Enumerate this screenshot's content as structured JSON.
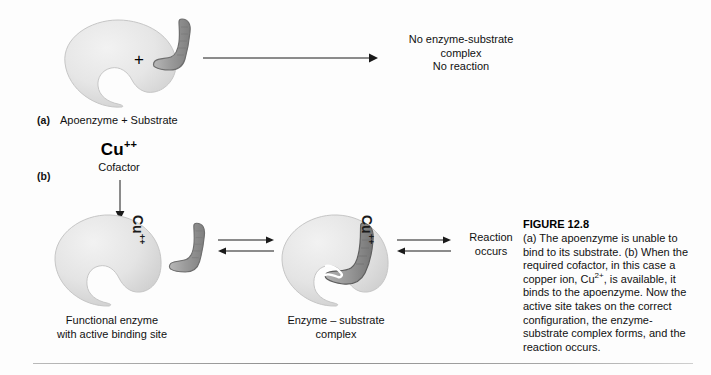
{
  "figure": {
    "title": "FIGURE 12.8",
    "caption_lines": [
      "(a) The apoenzyme is unable to",
      "bind to its substrate. (b) When the",
      "required cofactor, in this case a",
      "copper ion, Cu2+, is available, it",
      "binds to the apoenzyme. Now the",
      "active site takes on the correct",
      "configuration, the enzyme-",
      "substrate complex forms, and the",
      "reaction occurs."
    ],
    "caption_text": "(a) The apoenzyme is unable to bind to its substrate. (b) When the required cofactor, in this case a copper ion, Cu2+, is available, it binds to the apoenzyme. Now the active site takes on the correct configuration, the enzyme-substrate complex forms, and the reaction occurs.",
    "caption_ion_base": "Cu",
    "caption_ion_charge": "2+"
  },
  "panel_a": {
    "label": "(a)",
    "caption": "Apoenzyme + Substrate",
    "plus": "+",
    "outcome_lines": [
      "No enzyme-substrate",
      "complex",
      "No reaction"
    ],
    "enzyme_name": "apoenzyme-shape",
    "substrate_name": "substrate-shape"
  },
  "panel_b": {
    "label": "(b)",
    "cofactor_symbol_base": "Cu",
    "cofactor_symbol_charge": "++",
    "cofactor_word": "Cofactor",
    "ion_label_base": "Cu",
    "ion_label_charge": "++",
    "functional_enzyme_caption_lines": [
      "Functional enzyme",
      "with active binding site"
    ],
    "complex_caption_lines": [
      "Enzyme – substrate",
      "complex"
    ],
    "reaction_lines": [
      "Reaction",
      "occurs"
    ]
  },
  "colors": {
    "enzyme_fill_light": "#e8e8e8",
    "enzyme_fill_mid": "#d9d9d9",
    "enzyme_edge": "#c0c0c0",
    "substrate_fill": "#a0a0a0",
    "substrate_edge": "#6e6e6e",
    "arrow": "#1a1a1a",
    "text": "#111111",
    "background": "#ffffff"
  }
}
